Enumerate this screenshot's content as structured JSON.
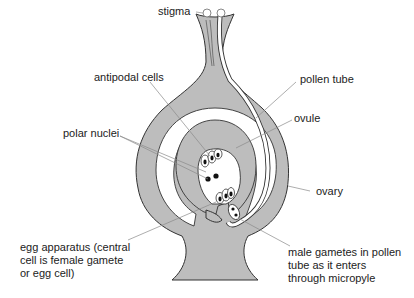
{
  "diagram": {
    "colors": {
      "tissue": "#bdbdbd",
      "outline": "#333333",
      "leader": "#8a8a8a",
      "text": "#222222",
      "background": "#ffffff"
    },
    "labels": {
      "stigma": "stigma",
      "antipodal_cells": "antipodal cells",
      "pollen_tube": "pollen tube",
      "ovule": "ovule",
      "polar_nuclei": "polar nuclei",
      "ovary": "ovary",
      "egg_apparatus": [
        "egg apparatus (central",
        "cell is female gamete",
        "or egg cell)"
      ],
      "male_gametes": [
        "male gametes in pollen",
        "tube as it enters",
        "through micropyle"
      ]
    }
  }
}
